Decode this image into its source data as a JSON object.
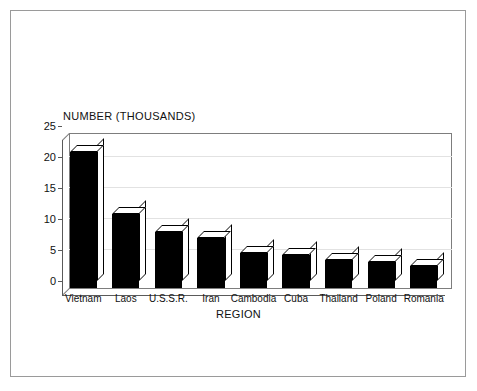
{
  "chart_data": {
    "type": "bar",
    "title": "NUMBER (THOUSANDS)",
    "xlabel": "REGION",
    "ylabel": "",
    "categories": [
      "Vietnam",
      "Laos",
      "U.S.S.R.",
      "Iran",
      "Cambodia",
      "Cuba",
      "Thailand",
      "Poland",
      "Romania"
    ],
    "values": [
      22,
      12,
      9,
      8,
      5.6,
      5.3,
      4.5,
      4.2,
      3.6
    ],
    "ylim": [
      0,
      25
    ],
    "yticks": [
      0,
      5,
      10,
      15,
      20,
      25
    ],
    "ytick_labels": [
      "0",
      "5",
      "10",
      "15",
      "20",
      "25"
    ],
    "grid": true,
    "legend": false,
    "style": "3d-bars",
    "bar_color": "#000000",
    "grid_color": "#e2e2e2",
    "axis_color": "#5a5a5a",
    "frame_color": "#9a9a9a"
  }
}
